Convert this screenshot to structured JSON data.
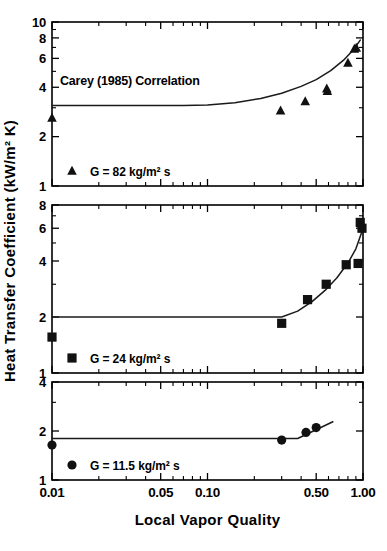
{
  "figure": {
    "xlabel": "Local Vapor Quality",
    "ylabel": "Heat Transfer Coefficient (kW/m² K)",
    "annotation": "Carey (1985) Correlation",
    "caption_fragment": ""
  },
  "xaxis": {
    "min": 0.01,
    "max": 1.0,
    "scale": "log",
    "ticklabels": [
      "0.01",
      "0.05",
      "0.10",
      "0.50",
      "1.00"
    ],
    "tickvalues": [
      0.01,
      0.05,
      0.1,
      0.5,
      1.0
    ],
    "minor_ticks": [
      0.02,
      0.03,
      0.04,
      0.06,
      0.07,
      0.08,
      0.09,
      0.2,
      0.3,
      0.4,
      0.6,
      0.7,
      0.8,
      0.9
    ]
  },
  "panels": [
    {
      "id": "panel-top",
      "legend_label": "G = 82 kg/m² s",
      "marker": "triangle",
      "ymin": 1,
      "ymax": 10,
      "yscale": "log",
      "yticklabels": [
        "10",
        "8",
        "6",
        "4",
        "2",
        "1"
      ],
      "ytickvalues": [
        10,
        8,
        6,
        4,
        2,
        1
      ],
      "yminor_ticks": [
        9,
        7,
        5,
        3
      ],
      "annotation": "Carey (1985) Correlation",
      "points": [
        {
          "x": 0.01,
          "y": 2.6
        },
        {
          "x": 0.295,
          "y": 2.88
        },
        {
          "x": 0.425,
          "y": 3.28
        },
        {
          "x": 0.585,
          "y": 3.92
        },
        {
          "x": 0.59,
          "y": 3.78
        },
        {
          "x": 0.8,
          "y": 5.62
        },
        {
          "x": 0.88,
          "y": 6.85
        },
        {
          "x": 0.905,
          "y": 6.95
        }
      ],
      "curve": [
        {
          "x": 0.01,
          "y": 3.1
        },
        {
          "x": 0.07,
          "y": 3.1
        },
        {
          "x": 0.1,
          "y": 3.12
        },
        {
          "x": 0.15,
          "y": 3.22
        },
        {
          "x": 0.22,
          "y": 3.42
        },
        {
          "x": 0.3,
          "y": 3.68
        },
        {
          "x": 0.4,
          "y": 4.05
        },
        {
          "x": 0.5,
          "y": 4.45
        },
        {
          "x": 0.62,
          "y": 5.05
        },
        {
          "x": 0.75,
          "y": 5.85
        },
        {
          "x": 0.87,
          "y": 6.8
        },
        {
          "x": 0.96,
          "y": 7.75
        }
      ]
    },
    {
      "id": "panel-middle",
      "legend_label": "G = 24 kg/m² s",
      "marker": "square",
      "ymin": 1,
      "ymax": 8,
      "yscale": "log",
      "yticklabels": [
        "8",
        "6",
        "4",
        "2",
        "1"
      ],
      "ytickvalues": [
        8,
        6,
        4,
        2,
        1
      ],
      "yminor_ticks": [
        7,
        5,
        3
      ],
      "points": [
        {
          "x": 0.01,
          "y": 1.56
        },
        {
          "x": 0.3,
          "y": 1.85
        },
        {
          "x": 0.44,
          "y": 2.48
        },
        {
          "x": 0.58,
          "y": 3.0
        },
        {
          "x": 0.78,
          "y": 3.82
        },
        {
          "x": 0.93,
          "y": 3.88
        },
        {
          "x": 0.96,
          "y": 6.45
        },
        {
          "x": 0.985,
          "y": 6.0
        }
      ],
      "curve": [
        {
          "x": 0.01,
          "y": 2.0
        },
        {
          "x": 0.3,
          "y": 2.0
        },
        {
          "x": 0.38,
          "y": 2.15
        },
        {
          "x": 0.47,
          "y": 2.42
        },
        {
          "x": 0.57,
          "y": 2.78
        },
        {
          "x": 0.68,
          "y": 3.25
        },
        {
          "x": 0.8,
          "y": 3.9
        },
        {
          "x": 0.9,
          "y": 4.65
        },
        {
          "x": 0.98,
          "y": 5.7
        }
      ]
    },
    {
      "id": "panel-bottom",
      "legend_label": "G = 11.5 kg/m² s",
      "marker": "circle",
      "ymin": 1,
      "ymax": 4,
      "yscale": "log",
      "yticklabels": [
        "4",
        "2",
        "1"
      ],
      "ytickvalues": [
        4,
        2,
        1
      ],
      "yminor_ticks": [
        3
      ],
      "points": [
        {
          "x": 0.01,
          "y": 1.64
        },
        {
          "x": 0.3,
          "y": 1.76
        },
        {
          "x": 0.43,
          "y": 1.96
        },
        {
          "x": 0.5,
          "y": 2.1
        }
      ],
      "curve": [
        {
          "x": 0.01,
          "y": 1.8
        },
        {
          "x": 0.38,
          "y": 1.8
        },
        {
          "x": 0.64,
          "y": 2.28
        }
      ]
    }
  ]
}
